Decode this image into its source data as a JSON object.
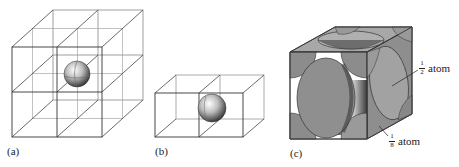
{
  "figure": {
    "panels": [
      {
        "id": "a",
        "label": "(a)",
        "description": "2x2x2 grid of cubic cells with one atom at the shared central corner"
      },
      {
        "id": "b",
        "label": "(b)",
        "description": "Two adjacent cubic cells sharing a face with an atom on the shared face"
      },
      {
        "id": "c",
        "label": "(c)",
        "description": "Face-centered cubic unit cell showing truncated atoms"
      }
    ],
    "annotations": [
      {
        "fraction_num": "1",
        "fraction_den": "2",
        "text": "atom"
      },
      {
        "fraction_num": "1",
        "fraction_den": "8",
        "text": "atom"
      }
    ],
    "colors": {
      "line": "#333333",
      "atom_face": "#9a9a9a",
      "atom_dark": "#5a5a5a",
      "background": "#ffffff"
    }
  }
}
